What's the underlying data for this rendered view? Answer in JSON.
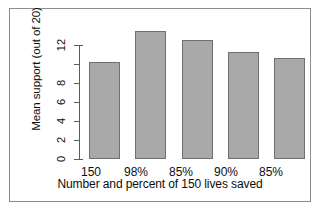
{
  "chart_data": {
    "type": "bar",
    "title": "",
    "xlabel": "Number and percent of 150 lives saved",
    "ylabel": "Mean support (out of 20)",
    "categories": [
      "150",
      "98%",
      "85%",
      "90%",
      "85%"
    ],
    "values": [
      9.6,
      12.6,
      11.7,
      10.5,
      9.9
    ],
    "ylim": [
      0,
      12.8
    ],
    "yticks": [
      0,
      2,
      4,
      6,
      8,
      10,
      12
    ],
    "ytick_labels": [
      "0",
      "2",
      "4",
      "6",
      "8",
      "",
      "12"
    ],
    "grid": false,
    "legend": null,
    "bar_color": "#a9a9a9",
    "bar_edge_color": "#6f6f6f",
    "axis_color": "#5a5a5a",
    "frame_color": "#8d8d8d",
    "background": "#ffffff"
  }
}
